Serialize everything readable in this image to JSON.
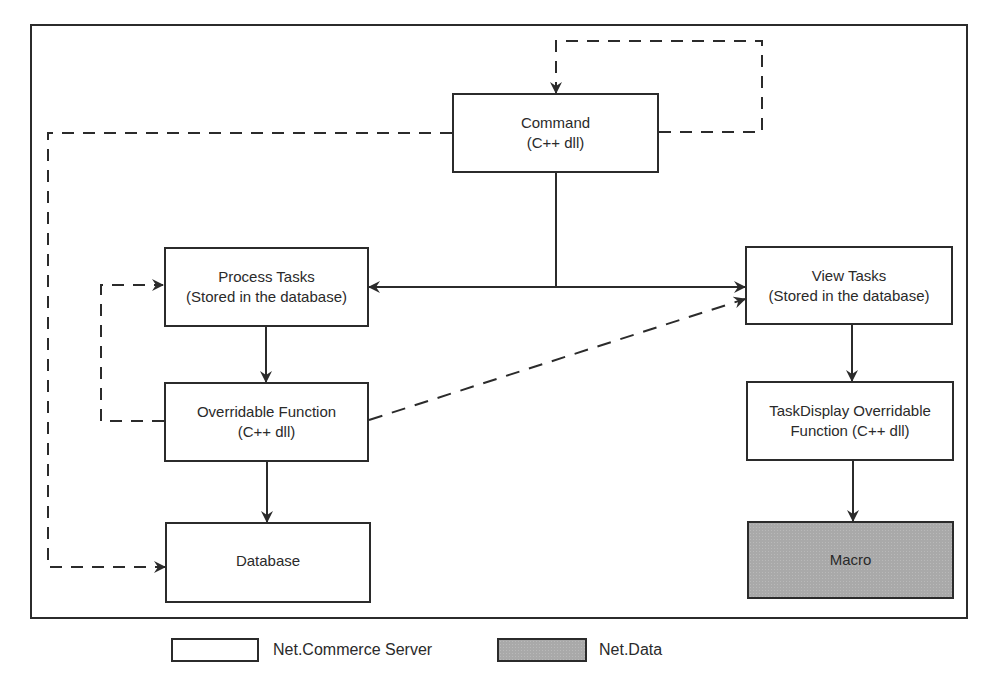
{
  "diagram": {
    "nodes": {
      "command": {
        "line1": "Command",
        "line2": "(C++ dll)",
        "group": "Net.Commerce Server"
      },
      "process_tasks": {
        "line1": "Process Tasks",
        "line2": "(Stored in the database)",
        "group": "Net.Commerce Server"
      },
      "overridable_function": {
        "line1": "Overridable Function",
        "line2": "(C++ dll)",
        "group": "Net.Commerce Server"
      },
      "database": {
        "line1": "Database",
        "group": "Net.Commerce Server"
      },
      "view_tasks": {
        "line1": "View Tasks",
        "line2": "(Stored in the database)",
        "group": "Net.Commerce Server"
      },
      "taskdisplay_function": {
        "line1": "TaskDisplay Overridable",
        "line2": "Function (C++ dll)",
        "group": "Net.Commerce Server"
      },
      "macro": {
        "line1": "Macro",
        "group": "Net.Data"
      }
    },
    "edges": [
      {
        "from": "command",
        "to": "process_tasks",
        "style": "solid"
      },
      {
        "from": "command",
        "to": "view_tasks",
        "style": "solid"
      },
      {
        "from": "command",
        "to": "command",
        "style": "dashed"
      },
      {
        "from": "command",
        "to": "database",
        "style": "dashed"
      },
      {
        "from": "process_tasks",
        "to": "overridable_function",
        "style": "solid"
      },
      {
        "from": "overridable_function",
        "to": "process_tasks",
        "style": "dashed"
      },
      {
        "from": "overridable_function",
        "to": "database",
        "style": "solid"
      },
      {
        "from": "overridable_function",
        "to": "view_tasks",
        "style": "dashed"
      },
      {
        "from": "view_tasks",
        "to": "taskdisplay_function",
        "style": "solid"
      },
      {
        "from": "taskdisplay_function",
        "to": "macro",
        "style": "solid"
      }
    ]
  },
  "legend": {
    "items": [
      {
        "label": "Net.Commerce Server",
        "fill": "#ffffff"
      },
      {
        "label": "Net.Data",
        "fill": "#a9a9a9"
      }
    ]
  },
  "colors": {
    "stroke": "#2b2b2b",
    "shaded_fill": "#a9a9a9",
    "background": "#ffffff"
  }
}
